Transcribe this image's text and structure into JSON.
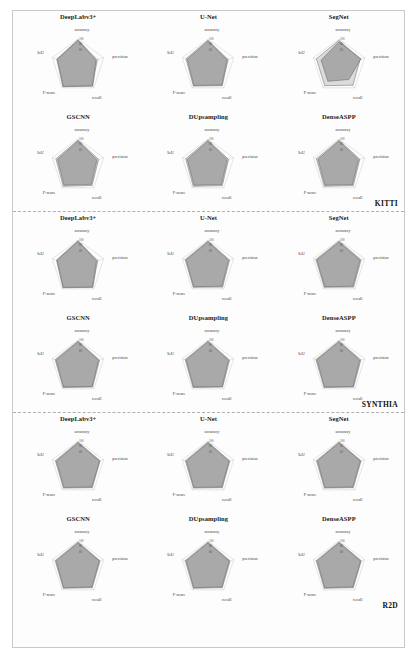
{
  "figure": {
    "axes": [
      "accuracy",
      "precision",
      "recall",
      "F-score",
      "IoU"
    ],
    "tick_values": [
      20,
      40,
      60,
      80,
      100
    ],
    "series_names": [
      "outer",
      "inner"
    ],
    "sections": [
      {
        "dataset_label": "KITTI",
        "charts": [
          {
            "title": "DeepLabv3+",
            "outer": [
              97,
              74,
              92,
              95,
              83
            ],
            "inner": [
              95,
              70,
              91,
              93,
              80
            ]
          },
          {
            "title": "U-Net",
            "outer": [
              96,
              78,
              90,
              92,
              86
            ],
            "inner": [
              92,
              74,
              87,
              89,
              81
            ]
          },
          {
            "title": "SegNet",
            "outer": [
              95,
              82,
              88,
              90,
              88
            ],
            "inner": [
              90,
              86,
              62,
              70,
              70
            ]
          },
          {
            "title": "GSCNN",
            "outer": [
              96,
              80,
              89,
              93,
              86
            ],
            "inner": [
              92,
              74,
              84,
              88,
              80
            ]
          },
          {
            "title": "DUpsampling",
            "outer": [
              96,
              80,
              90,
              93,
              87
            ],
            "inner": [
              92,
              75,
              85,
              88,
              81
            ]
          },
          {
            "title": "DenseASPP",
            "outer": [
              96,
              81,
              90,
              93,
              88
            ],
            "inner": [
              92,
              76,
              85,
              88,
              82
            ]
          }
        ]
      },
      {
        "dataset_label": "SYNTHIA",
        "charts": [
          {
            "title": "DeepLabv3+",
            "outer": [
              97,
              76,
              93,
              95,
              84
            ],
            "inner": [
              95,
              72,
              92,
              93,
              81
            ]
          },
          {
            "title": "U-Net",
            "outer": [
              96,
              84,
              92,
              93,
              89
            ],
            "inner": [
              93,
              80,
              88,
              90,
              85
            ]
          },
          {
            "title": "SegNet",
            "outer": [
              96,
              86,
              92,
              93,
              90
            ],
            "inner": [
              92,
              82,
              88,
              90,
              86
            ]
          },
          {
            "title": "GSCNN",
            "outer": [
              96,
              84,
              92,
              94,
              89
            ],
            "inner": [
              93,
              80,
              89,
              91,
              85
            ]
          },
          {
            "title": "DUpsampling",
            "outer": [
              96,
              84,
              92,
              94,
              89
            ],
            "inner": [
              93,
              80,
              89,
              91,
              85
            ]
          },
          {
            "title": "DenseASPP",
            "outer": [
              96,
              85,
              92,
              94,
              90
            ],
            "inner": [
              93,
              81,
              89,
              91,
              86
            ]
          }
        ]
      },
      {
        "dataset_label": "R2D",
        "charts": [
          {
            "title": "DeepLabv3+",
            "outer": [
              96,
              86,
              90,
              92,
              88
            ],
            "inner": [
              93,
              84,
              87,
              89,
              84
            ]
          },
          {
            "title": "U-Net",
            "outer": [
              96,
              85,
              90,
              92,
              88
            ],
            "inner": [
              93,
              82,
              87,
              89,
              84
            ]
          },
          {
            "title": "SegNet",
            "outer": [
              96,
              86,
              90,
              92,
              88
            ],
            "inner": [
              93,
              83,
              87,
              89,
              84
            ]
          },
          {
            "title": "GSCNN",
            "outer": [
              96,
              86,
              90,
              93,
              89
            ],
            "inner": [
              93,
              83,
              87,
              90,
              85
            ]
          },
          {
            "title": "DUpsampling",
            "outer": [
              96,
              86,
              90,
              93,
              89
            ],
            "inner": [
              93,
              83,
              87,
              90,
              85
            ]
          },
          {
            "title": "DenseASPP",
            "outer": [
              96,
              87,
              90,
              93,
              89
            ],
            "inner": [
              93,
              84,
              87,
              90,
              85
            ]
          }
        ]
      }
    ]
  },
  "chart_data": {
    "type": "radar",
    "axes": [
      "accuracy",
      "precision",
      "recall",
      "F-score",
      "IoU"
    ],
    "radial_range": [
      0,
      100
    ],
    "radial_ticks": [
      20,
      40,
      60,
      80,
      100
    ],
    "grid": true,
    "legend": "none",
    "panels": [
      {
        "dataset": "KITTI",
        "model": "DeepLabv3+",
        "series": [
          {
            "name": "outer",
            "values": [
              97,
              74,
              92,
              95,
              83
            ]
          },
          {
            "name": "inner",
            "values": [
              95,
              70,
              91,
              93,
              80
            ]
          }
        ]
      },
      {
        "dataset": "KITTI",
        "model": "U-Net",
        "series": [
          {
            "name": "outer",
            "values": [
              96,
              78,
              90,
              92,
              86
            ]
          },
          {
            "name": "inner",
            "values": [
              92,
              74,
              87,
              89,
              81
            ]
          }
        ]
      },
      {
        "dataset": "KITTI",
        "model": "SegNet",
        "series": [
          {
            "name": "outer",
            "values": [
              95,
              82,
              88,
              90,
              88
            ]
          },
          {
            "name": "inner",
            "values": [
              90,
              86,
              62,
              70,
              70
            ]
          }
        ]
      },
      {
        "dataset": "KITTI",
        "model": "GSCNN",
        "series": [
          {
            "name": "outer",
            "values": [
              96,
              80,
              89,
              93,
              86
            ]
          },
          {
            "name": "inner",
            "values": [
              92,
              74,
              84,
              88,
              80
            ]
          }
        ]
      },
      {
        "dataset": "KITTI",
        "model": "DUpsampling",
        "series": [
          {
            "name": "outer",
            "values": [
              96,
              80,
              90,
              93,
              87
            ]
          },
          {
            "name": "inner",
            "values": [
              92,
              75,
              85,
              88,
              81
            ]
          }
        ]
      },
      {
        "dataset": "KITTI",
        "model": "DenseASPP",
        "series": [
          {
            "name": "outer",
            "values": [
              96,
              81,
              90,
              93,
              88
            ]
          },
          {
            "name": "inner",
            "values": [
              92,
              76,
              85,
              88,
              82
            ]
          }
        ]
      },
      {
        "dataset": "SYNTHIA",
        "model": "DeepLabv3+",
        "series": [
          {
            "name": "outer",
            "values": [
              97,
              76,
              93,
              95,
              84
            ]
          },
          {
            "name": "inner",
            "values": [
              95,
              72,
              92,
              93,
              81
            ]
          }
        ]
      },
      {
        "dataset": "SYNTHIA",
        "model": "U-Net",
        "series": [
          {
            "name": "outer",
            "values": [
              96,
              84,
              92,
              93,
              89
            ]
          },
          {
            "name": "inner",
            "values": [
              93,
              80,
              88,
              90,
              85
            ]
          }
        ]
      },
      {
        "dataset": "SYNTHIA",
        "model": "SegNet",
        "series": [
          {
            "name": "outer",
            "values": [
              96,
              86,
              92,
              93,
              90
            ]
          },
          {
            "name": "inner",
            "values": [
              92,
              82,
              88,
              90,
              86
            ]
          }
        ]
      },
      {
        "dataset": "SYNTHIA",
        "model": "GSCNN",
        "series": [
          {
            "name": "outer",
            "values": [
              96,
              84,
              92,
              94,
              89
            ]
          },
          {
            "name": "inner",
            "values": [
              93,
              80,
              89,
              91,
              85
            ]
          }
        ]
      },
      {
        "dataset": "SYNTHIA",
        "model": "DUpsampling",
        "series": [
          {
            "name": "outer",
            "values": [
              96,
              84,
              92,
              94,
              89
            ]
          },
          {
            "name": "inner",
            "values": [
              93,
              80,
              89,
              91,
              85
            ]
          }
        ]
      },
      {
        "dataset": "SYNTHIA",
        "model": "DenseASPP",
        "series": [
          {
            "name": "outer",
            "values": [
              96,
              85,
              92,
              94,
              90
            ]
          },
          {
            "name": "inner",
            "values": [
              93,
              81,
              89,
              91,
              86
            ]
          }
        ]
      },
      {
        "dataset": "R2D",
        "model": "DeepLabv3+",
        "series": [
          {
            "name": "outer",
            "values": [
              96,
              86,
              90,
              92,
              88
            ]
          },
          {
            "name": "inner",
            "values": [
              93,
              84,
              87,
              89,
              84
            ]
          }
        ]
      },
      {
        "dataset": "R2D",
        "model": "U-Net",
        "series": [
          {
            "name": "outer",
            "values": [
              96,
              85,
              90,
              92,
              88
            ]
          },
          {
            "name": "inner",
            "values": [
              93,
              82,
              87,
              89,
              84
            ]
          }
        ]
      },
      {
        "dataset": "R2D",
        "model": "SegNet",
        "series": [
          {
            "name": "outer",
            "values": [
              96,
              86,
              90,
              92,
              88
            ]
          },
          {
            "name": "inner",
            "values": [
              93,
              83,
              87,
              89,
              84
            ]
          }
        ]
      },
      {
        "dataset": "R2D",
        "model": "GSCNN",
        "series": [
          {
            "name": "outer",
            "values": [
              96,
              86,
              90,
              93,
              89
            ]
          },
          {
            "name": "inner",
            "values": [
              93,
              83,
              87,
              90,
              85
            ]
          }
        ]
      },
      {
        "dataset": "R2D",
        "model": "DUpsampling",
        "series": [
          {
            "name": "outer",
            "values": [
              96,
              86,
              90,
              93,
              89
            ]
          },
          {
            "name": "inner",
            "values": [
              93,
              83,
              87,
              90,
              85
            ]
          }
        ]
      },
      {
        "dataset": "R2D",
        "model": "DenseASPP",
        "series": [
          {
            "name": "outer",
            "values": [
              96,
              87,
              90,
              93,
              89
            ]
          },
          {
            "name": "inner",
            "values": [
              93,
              84,
              87,
              90,
              85
            ]
          }
        ]
      }
    ],
    "colors": {
      "outer_fill": "#d9d9d9",
      "inner_fill": "#9e9e9e",
      "stroke": "#555555"
    }
  }
}
